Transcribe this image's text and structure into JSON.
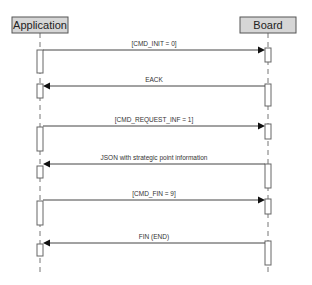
{
  "diagram": {
    "type": "sequence",
    "participants": [
      {
        "id": "application",
        "label": "Application",
        "box": [
          12,
          17,
          56,
          16
        ],
        "lifeline_x": 40
      },
      {
        "id": "board",
        "label": "Board",
        "box": [
          240,
          17,
          56,
          16
        ],
        "lifeline_x": 268
      }
    ],
    "lifeline_range": [
      33,
      273
    ],
    "messages": [
      {
        "label": "[CMD_INIT = 0]",
        "from": "application",
        "to": "board",
        "y": 50
      },
      {
        "label": "EACK",
        "from": "board",
        "to": "application",
        "y": 86
      },
      {
        "label": "[CMD_REQUEST_INF = 1]",
        "from": "application",
        "to": "board",
        "y": 126
      },
      {
        "label": "JSON with strategic point information",
        "from": "board",
        "to": "application",
        "y": 164
      },
      {
        "label": "[CMD_FIN = 9]",
        "from": "application",
        "to": "board",
        "y": 200
      },
      {
        "label": "FIN (END)",
        "from": "board",
        "to": "application",
        "y": 243
      }
    ],
    "activations": {
      "application": [
        [
          50,
          73
        ],
        [
          84,
          98
        ],
        [
          127,
          151
        ],
        [
          166,
          178
        ],
        [
          201,
          225
        ],
        [
          244,
          256
        ]
      ],
      "board": [
        [
          48,
          62
        ],
        [
          84,
          106
        ],
        [
          124,
          139
        ],
        [
          164,
          188
        ],
        [
          199,
          214
        ],
        [
          241,
          265
        ]
      ]
    },
    "colors": {
      "participant_fill": "#d6d6d6",
      "participant_stroke": "#555555",
      "line": "#444444",
      "arrowhead": "#111111",
      "text": "#222222"
    }
  }
}
